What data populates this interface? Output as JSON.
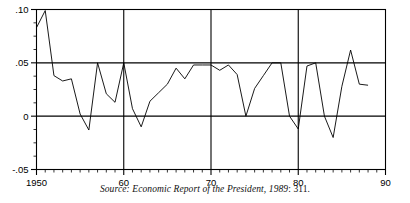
{
  "figure": {
    "source_note_prefix": "Source: Economic Report of the President, 1989",
    "source_note_page": ": 311."
  },
  "chart_data": {
    "type": "line",
    "title": "",
    "subtitle": "",
    "xlabel": "",
    "ylabel": "",
    "grid": "major horizontal at .05 and 0; major vertical at decades",
    "legend": "none",
    "xlim": [
      1950,
      1990
    ],
    "ylim": [
      -0.05,
      0.1
    ],
    "x_tick_labels": [
      "1950",
      "60",
      "70",
      "80",
      "90"
    ],
    "x_tick_values": [
      1950,
      1960,
      1970,
      1980,
      1990
    ],
    "x_minor_tick_step": 1,
    "y_tick_labels": [
      ".10",
      ".05",
      "0",
      "-.05"
    ],
    "y_tick_values": [
      0.1,
      0.05,
      0.0,
      -0.05
    ],
    "y_minor_tick_step": 0.0125,
    "series": [
      {
        "name": "inflation-rate",
        "x": [
          1950,
          1951,
          1952,
          1953,
          1954,
          1955,
          1956,
          1957,
          1958,
          1959,
          1960,
          1961,
          1962,
          1963,
          1964,
          1965,
          1966,
          1967,
          1968,
          1969,
          1970,
          1971,
          1972,
          1973,
          1974,
          1975,
          1976,
          1977,
          1978,
          1979,
          1980,
          1981,
          1982,
          1983,
          1984,
          1985,
          1986,
          1987,
          1988
        ],
        "values": [
          0.083,
          0.099,
          0.038,
          0.033,
          0.035,
          0.002,
          -0.013,
          0.05,
          0.021,
          0.013,
          0.05,
          0.007,
          -0.01,
          0.014,
          0.022,
          0.03,
          0.045,
          0.035,
          0.048,
          0.048,
          0.048,
          0.043,
          0.048,
          0.039,
          0.0,
          0.026,
          0.038,
          0.05,
          0.05,
          0.0,
          -0.012,
          0.047,
          0.05,
          0.0,
          -0.02,
          0.028,
          0.062,
          0.03,
          0.029
        ]
      }
    ]
  }
}
